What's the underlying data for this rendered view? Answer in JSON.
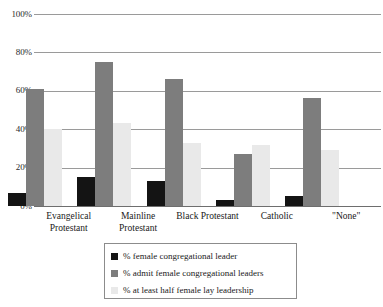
{
  "chart_data": {
    "type": "bar",
    "title": "",
    "subtitle": "",
    "xlabel": "",
    "ylabel": "",
    "ylim": [
      0,
      100
    ],
    "y_ticks": [
      "0%",
      "20%",
      "40%",
      "60%",
      "80%",
      "100%"
    ],
    "y_tick_values": [
      0,
      20,
      40,
      60,
      80,
      100
    ],
    "grid": true,
    "legend_position": "bottom",
    "categories": [
      "Evangelical Protestant",
      "Mainline Protestant",
      "Black Protestant",
      "Catholic",
      "\"None\""
    ],
    "category_lines": [
      [
        "Evangelical",
        "Protestant"
      ],
      [
        "Mainline",
        "Protestant"
      ],
      [
        "Black Protestant"
      ],
      [
        "Catholic"
      ],
      [
        "\"None\""
      ]
    ],
    "series": [
      {
        "name": "% female congregational leader",
        "color": "#141414",
        "values": [
          7,
          15,
          13,
          3,
          5
        ]
      },
      {
        "name": "% admit female congregational leaders",
        "color": "#7d7d7d",
        "values": [
          61,
          75,
          66,
          27,
          56
        ]
      },
      {
        "name": "% at least half female lay leadership",
        "color": "#e9e9e9",
        "values": [
          40,
          43,
          33,
          32,
          29
        ]
      }
    ]
  }
}
